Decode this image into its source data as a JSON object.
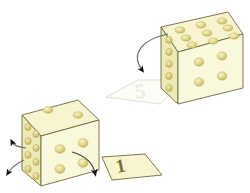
{
  "figure": {
    "background_color": "#ffffff"
  },
  "palette": {
    "face_top": "#f7f4cf",
    "face_front": "#f9f6d6",
    "face_left": "#f2efc2",
    "edge_stroke": "#6b6b40",
    "dot_fill": "#e2d88a",
    "dot_shade": "#c8ba60",
    "dot_highlight": "#f5eec0",
    "arrow_stroke": "#6b6b6b",
    "arrow_head": "#111111",
    "sheet_solid_fill": "#f7f4cf",
    "sheet_ghost_fill": "#fcfcf6",
    "sheet_ghost_stroke": "#d8d8cc",
    "ghost_numeral_color": "#e8e8dc",
    "solid_numeral_color": "#7a6a32"
  },
  "objects": [
    {
      "id": "upper-die",
      "name": "upper-right-die",
      "position": "top-right",
      "faces": [
        {
          "name": "top-face",
          "dot_count": 9,
          "layout": "3x3"
        },
        {
          "name": "front-face",
          "dot_count": 4,
          "layout": "2x2"
        },
        {
          "name": "left-face",
          "dot_count": 5,
          "layout": "1x5-column"
        }
      ],
      "peeled_sheet": {
        "name": "ghost-sheet",
        "numeral": "5",
        "style": "ghosted",
        "note": "translucent outline sheet lying on ground showing the numeral 5"
      },
      "arrows": [
        {
          "name": "peel-arrow",
          "direction": "down-left",
          "style": "curved"
        }
      ]
    },
    {
      "id": "lower-die",
      "name": "lower-left-die",
      "position": "bottom-left",
      "faces": [
        {
          "name": "top-face",
          "dot_count": 2,
          "layout": "diagonal-pair"
        },
        {
          "name": "front-face",
          "dot_count": 4,
          "layout": "2x2"
        },
        {
          "name": "left-face",
          "dot_count": 8,
          "layout": "2x4-column"
        }
      ],
      "peeled_sheet": {
        "name": "solid-sheet",
        "numeral": "1",
        "style": "solid",
        "note": "opaque yellow sheet lying on ground showing the numeral 1"
      },
      "arrows": [
        {
          "name": "front-peel-arrow",
          "direction": "down-right",
          "style": "curved"
        },
        {
          "name": "left-peel-arrow-upper",
          "direction": "up-left",
          "style": "curved"
        },
        {
          "name": "left-peel-arrow-lower",
          "direction": "up-left",
          "style": "curved"
        }
      ]
    }
  ],
  "labels": {
    "ghost_numeral": "5",
    "solid_numeral": "1"
  }
}
